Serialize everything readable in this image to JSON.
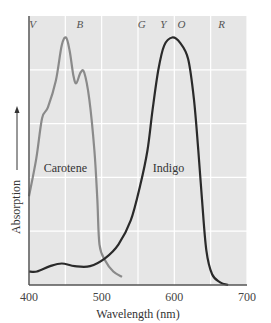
{
  "chart_data": {
    "type": "line",
    "title": "",
    "xlabel": "Wavelength (nm)",
    "ylabel": "Absorption",
    "xlim": [
      400,
      700
    ],
    "ylim": [
      0,
      1
    ],
    "grid": true,
    "x_ticks": [
      400,
      500,
      600,
      700
    ],
    "x_tick_labels": [
      "400",
      "500",
      "600",
      "700"
    ],
    "color_bands": [
      {
        "label": "V",
        "x": 405
      },
      {
        "label": "B",
        "x": 470
      },
      {
        "label": "G",
        "x": 555
      },
      {
        "label": "Y",
        "x": 585
      },
      {
        "label": "O",
        "x": 610
      },
      {
        "label": "R",
        "x": 665
      }
    ],
    "series": [
      {
        "name": "Carotene",
        "color": "#8a8a8a",
        "label_pos": {
          "x": 450,
          "y": 0.42
        },
        "points": [
          [
            400,
            0.33
          ],
          [
            410,
            0.47
          ],
          [
            418,
            0.62
          ],
          [
            426,
            0.66
          ],
          [
            437,
            0.76
          ],
          [
            445,
            0.89
          ],
          [
            451,
            0.92
          ],
          [
            456,
            0.87
          ],
          [
            461,
            0.78
          ],
          [
            465,
            0.75
          ],
          [
            471,
            0.79
          ],
          [
            476,
            0.79
          ],
          [
            483,
            0.69
          ],
          [
            490,
            0.5
          ],
          [
            494,
            0.32
          ],
          [
            497,
            0.15
          ],
          [
            505,
            0.09
          ],
          [
            516,
            0.05
          ],
          [
            528,
            0.03
          ]
        ]
      },
      {
        "name": "Indigo",
        "color": "#2a2a2a",
        "label_pos": {
          "x": 592,
          "y": 0.42
        },
        "points": [
          [
            400,
            0.05
          ],
          [
            411,
            0.05
          ],
          [
            429,
            0.07
          ],
          [
            445,
            0.08
          ],
          [
            463,
            0.07
          ],
          [
            484,
            0.07
          ],
          [
            505,
            0.1
          ],
          [
            523,
            0.15
          ],
          [
            540,
            0.24
          ],
          [
            553,
            0.37
          ],
          [
            563,
            0.5
          ],
          [
            570,
            0.65
          ],
          [
            578,
            0.8
          ],
          [
            586,
            0.89
          ],
          [
            597,
            0.92
          ],
          [
            608,
            0.9
          ],
          [
            619,
            0.84
          ],
          [
            627,
            0.69
          ],
          [
            633,
            0.5
          ],
          [
            638,
            0.32
          ],
          [
            644,
            0.13
          ],
          [
            652,
            0.04
          ],
          [
            663,
            0.01
          ],
          [
            674,
            0.0
          ]
        ]
      }
    ]
  },
  "plot": {
    "background": "#e6e6e6",
    "grid_color": "#ffffff",
    "left": 29,
    "top": 16,
    "right": 247,
    "bottom": 285,
    "v_grid": [
      400,
      450,
      500,
      550,
      600,
      650,
      700
    ],
    "h_grid_count": 5
  }
}
